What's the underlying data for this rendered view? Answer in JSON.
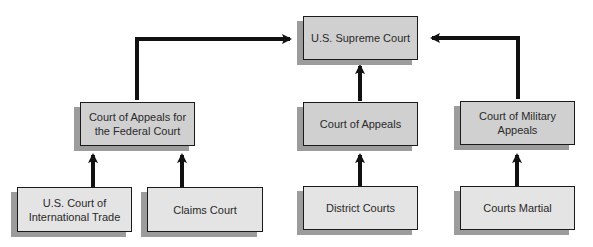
{
  "colors": {
    "upper_box_fill": "#d0d0d0",
    "lower_box_fill": "#e4e4e4",
    "shadow": "#9c9c9c",
    "border": "#1a1a1a",
    "arrow": "#111111"
  },
  "nodes": {
    "supreme": {
      "label": "U.S. Supreme Court"
    },
    "federal_appeals": {
      "label": "Court of Appeals for the Federal Court"
    },
    "appeals": {
      "label": "Court of Appeals"
    },
    "military_appeals": {
      "label": "Court of Military Appeals"
    },
    "international_trade": {
      "label": "U.S. Court of International Trade"
    },
    "claims": {
      "label": "Claims Court"
    },
    "district": {
      "label": "District Courts"
    },
    "martial": {
      "label": "Courts Martial"
    }
  },
  "edges": [
    {
      "from": "federal_appeals",
      "to": "supreme"
    },
    {
      "from": "appeals",
      "to": "supreme"
    },
    {
      "from": "military_appeals",
      "to": "supreme"
    },
    {
      "from": "international_trade",
      "to": "federal_appeals"
    },
    {
      "from": "claims",
      "to": "federal_appeals"
    },
    {
      "from": "district",
      "to": "appeals"
    },
    {
      "from": "martial",
      "to": "military_appeals"
    }
  ]
}
